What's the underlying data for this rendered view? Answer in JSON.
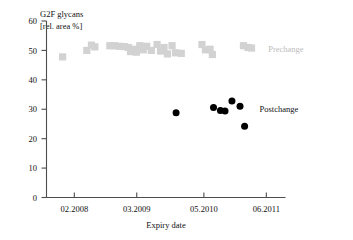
{
  "chart_data": {
    "type": "scatter",
    "title": "G2F glycans",
    "subtitle": "[rel. area %]",
    "xlabel": "Expiry date",
    "ylabel": "",
    "grid": false,
    "legend_position": "right-inside",
    "xlim": [
      2007.6,
      2011.75
    ],
    "ylim": [
      0,
      60
    ],
    "yticks": [
      0,
      10,
      20,
      30,
      40,
      50,
      60
    ],
    "ytick_labels": [
      "0",
      "10",
      "20",
      "30",
      "40",
      "50",
      "60"
    ],
    "xticks": [
      2008.083,
      2009.167,
      2010.333,
      2011.417
    ],
    "xtick_labels": [
      "02.2008",
      "03.2009",
      "05.2010",
      "06.2011"
    ],
    "series": [
      {
        "name": "Prechange",
        "color": "#d2d2d2",
        "marker": "square",
        "points": [
          {
            "x": 2007.88,
            "y": 47.8
          },
          {
            "x": 2008.3,
            "y": 50.0
          },
          {
            "x": 2008.38,
            "y": 51.8
          },
          {
            "x": 2008.44,
            "y": 51.2
          },
          {
            "x": 2008.7,
            "y": 51.6
          },
          {
            "x": 2008.78,
            "y": 51.6
          },
          {
            "x": 2008.86,
            "y": 51.4
          },
          {
            "x": 2008.95,
            "y": 51.3
          },
          {
            "x": 2009.02,
            "y": 51.0
          },
          {
            "x": 2009.06,
            "y": 49.6
          },
          {
            "x": 2009.12,
            "y": 50.4
          },
          {
            "x": 2009.16,
            "y": 49.4
          },
          {
            "x": 2009.22,
            "y": 51.6
          },
          {
            "x": 2009.28,
            "y": 50.2
          },
          {
            "x": 2009.34,
            "y": 51.4
          },
          {
            "x": 2009.42,
            "y": 50.0
          },
          {
            "x": 2009.52,
            "y": 52.0
          },
          {
            "x": 2009.58,
            "y": 49.8
          },
          {
            "x": 2009.64,
            "y": 51.0
          },
          {
            "x": 2009.7,
            "y": 48.8
          },
          {
            "x": 2009.78,
            "y": 51.6
          },
          {
            "x": 2009.84,
            "y": 49.2
          },
          {
            "x": 2009.94,
            "y": 49.0
          },
          {
            "x": 2010.3,
            "y": 52.0
          },
          {
            "x": 2010.36,
            "y": 50.2
          },
          {
            "x": 2010.44,
            "y": 50.4
          },
          {
            "x": 2010.48,
            "y": 48.6
          },
          {
            "x": 2011.02,
            "y": 51.6
          },
          {
            "x": 2011.1,
            "y": 51.0
          },
          {
            "x": 2011.16,
            "y": 50.8
          }
        ]
      },
      {
        "name": "Postchange",
        "color": "#000000",
        "marker": "circle",
        "points": [
          {
            "x": 2009.85,
            "y": 28.8
          },
          {
            "x": 2010.5,
            "y": 30.6
          },
          {
            "x": 2010.62,
            "y": 29.6
          },
          {
            "x": 2010.7,
            "y": 29.4
          },
          {
            "x": 2010.82,
            "y": 32.8
          },
          {
            "x": 2010.96,
            "y": 31.0
          },
          {
            "x": 2011.04,
            "y": 24.2
          }
        ]
      }
    ],
    "annotations": [
      {
        "text": "Prechange",
        "x": 2011.45,
        "y": 50.6,
        "color": "#bdbdbd"
      },
      {
        "text": "Postchange",
        "x": 2011.3,
        "y": 30.2,
        "color": "#111111"
      }
    ]
  }
}
